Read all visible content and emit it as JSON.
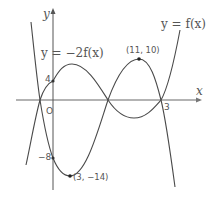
{
  "figure": {
    "axes": {
      "x_label": "x",
      "y_label": "y",
      "origin_label": "O"
    },
    "curves": [
      {
        "name": "f",
        "label": "y = f(x)"
      },
      {
        "name": "neg2f",
        "label": "y = −2f(x)"
      }
    ],
    "tick_labels": {
      "y_4": "4",
      "y_neg8": "−8",
      "x_3": "3"
    },
    "points": {
      "max_neg2f": "(11, 10)",
      "min_neg2f": "(3, −14)"
    },
    "colors": {
      "axis": "#9a9a9a",
      "curve": "#4a4a4a",
      "text": "#555555"
    }
  }
}
